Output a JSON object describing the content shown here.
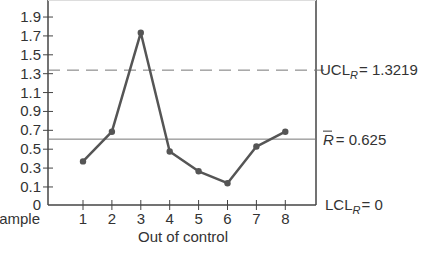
{
  "chart_data": {
    "type": "line",
    "title": "",
    "xlabel": "Sample",
    "xlabel_note": "Out of control",
    "ylabel": "",
    "x": [
      1,
      2,
      3,
      4,
      5,
      6,
      7,
      8
    ],
    "categories": [
      "1",
      "2",
      "3",
      "4",
      "5",
      "6",
      "7",
      "8"
    ],
    "series": [
      {
        "name": "Sample range R",
        "values": [
          0.4,
          0.7,
          1.7,
          0.5,
          0.3,
          0.18,
          0.55,
          0.7
        ]
      }
    ],
    "ylim": [
      0,
      2.0
    ],
    "yticks": [
      0,
      0.1,
      0.3,
      0.5,
      0.7,
      0.9,
      1.1,
      1.3,
      1.5,
      1.7,
      1.9
    ],
    "ytick_labels": [
      "0",
      "0.1",
      "0.3",
      "0.5",
      "0.7",
      "0.9",
      "1.1",
      "1.3",
      "1.5",
      "1.7",
      "1.9"
    ],
    "control_lines": {
      "ucl": {
        "value": 1.3219,
        "style": "dashed",
        "label_main": "UCL",
        "label_sub": "R",
        "label_value": "= 1.3219"
      },
      "center": {
        "value": 0.625,
        "style": "solid",
        "label_main": "R",
        "label_value": "= 0.625"
      },
      "lcl": {
        "value": 0,
        "style": "solid",
        "label_main": "LCL",
        "label_sub": "R",
        "label_value": "= 0"
      }
    },
    "grid": false,
    "legend": "none",
    "annotations": [
      "Out of control (sample 3)"
    ]
  },
  "colors": {
    "line": "#555555",
    "axis": "#444444",
    "text": "#333333",
    "control": "#777777"
  }
}
